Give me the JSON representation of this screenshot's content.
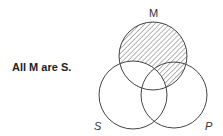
{
  "statement": "All M are S.",
  "diagram": {
    "type": "three-circle-venn",
    "circles": [
      {
        "id": "M",
        "label": "M",
        "cx": 153,
        "cy": 56,
        "r": 34
      },
      {
        "id": "S",
        "label": "S",
        "cx": 133,
        "cy": 95,
        "r": 34
      },
      {
        "id": "P",
        "label": "P",
        "cx": 174,
        "cy": 95,
        "r": 33
      }
    ],
    "shaded_region": "M outside S",
    "colors": {
      "stroke": "#444444",
      "hatch": "#555555",
      "text": "#222222"
    }
  }
}
